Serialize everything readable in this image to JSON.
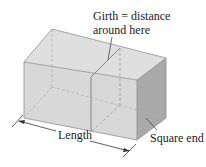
{
  "diagram": {
    "labels": {
      "girth_line1": "Girth = distance",
      "girth_line2": "around here",
      "length": "Length",
      "square_end": "Square end"
    },
    "colors": {
      "top_face": "#dfdfdf",
      "front_face": "#d8d8d8",
      "end_face": "#a9a9a9",
      "edge": "#8a8a8a",
      "girth_line": "#7a7a7a",
      "hidden_edge": "#a0a0a0",
      "annotation": "#1a1a1a"
    }
  }
}
